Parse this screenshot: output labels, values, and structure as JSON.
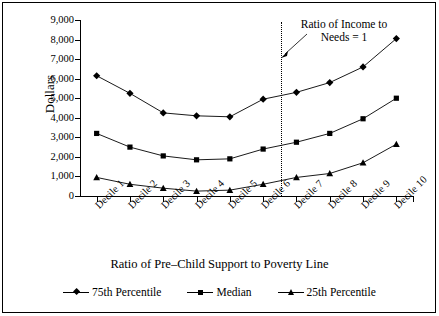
{
  "chart_data": {
    "type": "line",
    "title": "",
    "xlabel": "Ratio of Pre–Child Support to Poverty Line",
    "ylabel": "Dollars",
    "categories": [
      "Decile 1",
      "Decile 2",
      "Decile 3",
      "Decile 4",
      "Decile 5",
      "Decile 6",
      "Decile 7",
      "Decile 8",
      "Decile 9",
      "Decile 10"
    ],
    "ylim": [
      0,
      9000
    ],
    "ytick_labels": [
      "0",
      "1,000",
      "2,000",
      "3,000",
      "4,000",
      "5,000",
      "6,000",
      "7,000",
      "8,000",
      "9,000"
    ],
    "ytick_values": [
      0,
      1000,
      2000,
      3000,
      4000,
      5000,
      6000,
      7000,
      8000,
      9000
    ],
    "grid": false,
    "legend_position": "bottom",
    "series": [
      {
        "name": "75th Percentile",
        "marker": "diamond",
        "values": [
          6150,
          5250,
          4250,
          4100,
          4050,
          4950,
          5300,
          5800,
          6600,
          8050
        ]
      },
      {
        "name": "Median",
        "marker": "square",
        "values": [
          3200,
          2500,
          2050,
          1850,
          1900,
          2400,
          2750,
          3200,
          3950,
          5000
        ]
      },
      {
        "name": "25th Percentile",
        "marker": "triangle",
        "values": [
          950,
          600,
          400,
          250,
          300,
          600,
          950,
          1150,
          1700,
          2650
        ]
      }
    ],
    "annotations": [
      {
        "text": "Ratio of Income to Needs = 1",
        "line1": "Ratio of Income to",
        "line2": "Needs = 1",
        "type": "vertical-reference-line",
        "between_categories": [
          "Decile 6",
          "Decile 7"
        ]
      }
    ],
    "colors": {
      "line": "#000000",
      "marker": "#000000",
      "axis": "#000000",
      "background": "#ffffff"
    }
  }
}
